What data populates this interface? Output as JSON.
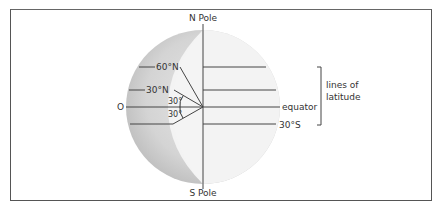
{
  "figure": {
    "type": "globe latitude diagram",
    "labels": {
      "north_pole": "N Pole",
      "south_pole": "S Pole",
      "center": "O",
      "lat_60n": "60°N",
      "lat_30n": "30°N",
      "equator": "equator",
      "lat_30s": "30°S",
      "angle_upper": "30°",
      "angle_lower": "30°",
      "bracket_label_line1": "lines of",
      "bracket_label_line2": "latitude"
    },
    "colors": {
      "globe_shade": "#c9c9c9",
      "crescent": "#f2f2f2",
      "lines": "#444444",
      "frame": "#555555"
    }
  }
}
